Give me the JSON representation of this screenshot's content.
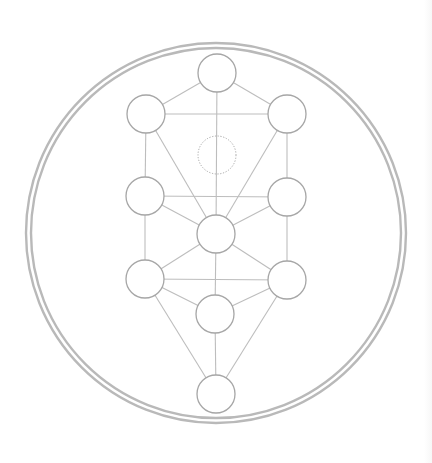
{
  "diagram": {
    "title": "",
    "colors": {
      "background": "#ffffff",
      "ring": "#b9b9b9",
      "node_stroke": "#a6a6a6",
      "path_stroke": "#bdbdbd",
      "hidden_node_stroke": "#a6a6a6"
    },
    "outer_ring": {
      "cx": 216,
      "cy": 233,
      "r_outer": 190,
      "r_inner": 185,
      "stroke_width": 2.4
    },
    "node_radius": 19,
    "nodes": [
      {
        "id": "kether",
        "cx": 217,
        "cy": 73,
        "style": "solid"
      },
      {
        "id": "chokmah",
        "cx": 287,
        "cy": 114,
        "style": "solid"
      },
      {
        "id": "binah",
        "cx": 146,
        "cy": 114,
        "style": "solid"
      },
      {
        "id": "daat",
        "cx": 217,
        "cy": 155,
        "style": "dotted"
      },
      {
        "id": "chesed",
        "cx": 287,
        "cy": 197,
        "style": "solid"
      },
      {
        "id": "geburah",
        "cx": 145,
        "cy": 196,
        "style": "solid"
      },
      {
        "id": "tiferet",
        "cx": 216,
        "cy": 234,
        "style": "solid"
      },
      {
        "id": "netzach",
        "cx": 287,
        "cy": 280,
        "style": "solid"
      },
      {
        "id": "hod",
        "cx": 145,
        "cy": 279,
        "style": "solid"
      },
      {
        "id": "yesod",
        "cx": 215,
        "cy": 314,
        "style": "solid"
      },
      {
        "id": "malkuth",
        "cx": 216,
        "cy": 394,
        "style": "solid"
      }
    ],
    "paths": [
      [
        "kether",
        "binah"
      ],
      [
        "kether",
        "chokmah"
      ],
      [
        "kether",
        "tiferet"
      ],
      [
        "binah",
        "chokmah"
      ],
      [
        "binah",
        "geburah"
      ],
      [
        "binah",
        "tiferet"
      ],
      [
        "chokmah",
        "chesed"
      ],
      [
        "chokmah",
        "tiferet"
      ],
      [
        "geburah",
        "chesed"
      ],
      [
        "geburah",
        "tiferet"
      ],
      [
        "geburah",
        "hod"
      ],
      [
        "chesed",
        "tiferet"
      ],
      [
        "chesed",
        "netzach"
      ],
      [
        "tiferet",
        "hod"
      ],
      [
        "tiferet",
        "netzach"
      ],
      [
        "tiferet",
        "yesod"
      ],
      [
        "hod",
        "netzach"
      ],
      [
        "hod",
        "yesod"
      ],
      [
        "hod",
        "malkuth"
      ],
      [
        "netzach",
        "yesod"
      ],
      [
        "netzach",
        "malkuth"
      ],
      [
        "yesod",
        "malkuth"
      ]
    ]
  }
}
